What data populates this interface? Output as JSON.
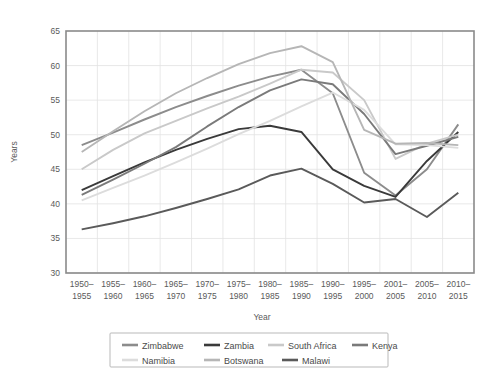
{
  "chart_data": {
    "type": "line",
    "title": "",
    "xlabel": "Year",
    "ylabel": "Years",
    "ylim": [
      30,
      65
    ],
    "yticks": [
      30,
      35,
      40,
      45,
      50,
      55,
      60,
      65
    ],
    "grid": true,
    "legend_position": "bottom",
    "categories": [
      "1950–\n1955",
      "1955–\n1960",
      "1960–\n1965",
      "1965–\n1970",
      "1970–\n1975",
      "1975–\n1980",
      "1980–\n1985",
      "1985–\n1990",
      "1990–\n1995",
      "1995–\n2000",
      "2001–\n2005",
      "2005–\n2010",
      "2010–\n2015"
    ],
    "categories_top": [
      "1950–",
      "1955–",
      "1960–",
      "1965–",
      "1970–",
      "1975–",
      "1980–",
      "1985–",
      "1990–",
      "1995–",
      "2001–",
      "2005–",
      "2010–"
    ],
    "categories_bottom": [
      "1955",
      "1960",
      "1965",
      "1970",
      "1975",
      "1980",
      "1985",
      "1990",
      "1995",
      "2000",
      "2005",
      "2010",
      "2015"
    ],
    "series": [
      {
        "name": "Zimbabwe",
        "color": "#8c8c8c",
        "values": [
          48.5,
          50.3,
          52.2,
          54.0,
          55.6,
          57.1,
          58.4,
          59.4,
          56.0,
          44.5,
          41.2,
          45.0,
          51.5
        ]
      },
      {
        "name": "Zambia",
        "color": "#3a3a3a",
        "values": [
          42.0,
          44.0,
          46.0,
          47.8,
          49.4,
          50.8,
          51.3,
          50.4,
          45.0,
          42.6,
          41.0,
          46.2,
          50.4
        ]
      },
      {
        "name": "South Africa",
        "color": "#c9c9c9",
        "values": [
          45.0,
          47.8,
          50.2,
          52.0,
          53.8,
          55.5,
          57.4,
          59.4,
          59.0,
          55.0,
          46.5,
          48.7,
          50.0
        ]
      },
      {
        "name": "Kenya",
        "color": "#7a7a7a",
        "values": [
          41.3,
          43.5,
          45.8,
          48.2,
          51.2,
          54.0,
          56.4,
          58.0,
          57.3,
          53.0,
          47.2,
          48.4,
          49.7
        ]
      },
      {
        "name": "Namibia",
        "color": "#dcdcdc",
        "values": [
          40.5,
          42.3,
          44.1,
          46.0,
          48.0,
          50.1,
          52.0,
          54.1,
          56.1,
          53.6,
          48.6,
          48.5,
          48.1
        ]
      },
      {
        "name": "Botswana",
        "color": "#b6b6b6",
        "values": [
          47.5,
          50.5,
          53.4,
          56.0,
          58.2,
          60.2,
          61.8,
          62.8,
          60.5,
          50.7,
          48.7,
          48.8,
          48.5
        ]
      },
      {
        "name": "Malawi",
        "color": "#5a5a5a",
        "values": [
          36.3,
          37.2,
          38.2,
          39.4,
          40.7,
          42.1,
          44.1,
          45.1,
          42.9,
          40.2,
          40.7,
          38.1,
          41.6
        ]
      }
    ]
  },
  "legend": {
    "row1": [
      "Zimbabwe",
      "Zambia",
      "South Africa",
      "Kenya"
    ],
    "row2": [
      "Namibia",
      "Botswana",
      "Malawi"
    ]
  }
}
